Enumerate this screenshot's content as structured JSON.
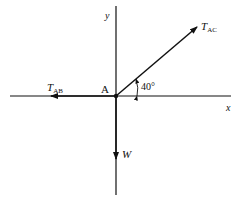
{
  "diagram": {
    "type": "free-body diagram",
    "colors": {
      "line": "#111111",
      "background": "#ffffff"
    },
    "axes": {
      "x_label": "x",
      "y_label": "y"
    },
    "point": {
      "label": "A"
    },
    "forces": [
      {
        "id": "T_AC",
        "symbol": "T",
        "subscript": "AC",
        "direction": "up-right",
        "angle_deg": 40
      },
      {
        "id": "T_AB",
        "symbol": "T",
        "subscript": "AB",
        "direction": "left"
      },
      {
        "id": "W",
        "symbol": "W",
        "subscript": "",
        "direction": "down"
      }
    ],
    "angle": {
      "label": "40°",
      "between": [
        "T_AC",
        "+x axis"
      ]
    }
  }
}
